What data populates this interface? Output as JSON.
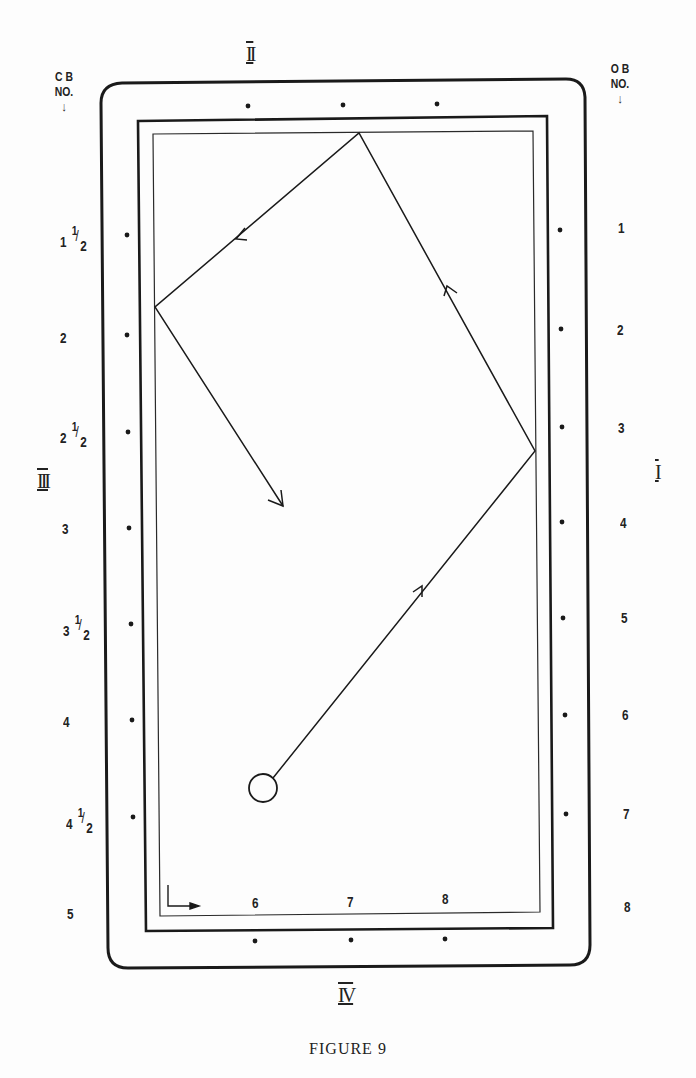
{
  "figure": {
    "caption": "FIGURE 9",
    "headers": {
      "left": {
        "line1": "C B",
        "line2": "NO.",
        "arrow": "↓"
      },
      "right": {
        "line1": "O B",
        "line2": "NO.",
        "arrow": "↓"
      }
    },
    "rail_labels": {
      "top": "II",
      "right": "I",
      "left": "III",
      "bottom": "IV"
    },
    "left_numbers": [
      {
        "whole": "1",
        "fraction": "1/2"
      },
      {
        "whole": "2",
        "fraction": ""
      },
      {
        "whole": "2",
        "fraction": "1/2"
      },
      {
        "whole": "3",
        "fraction": ""
      },
      {
        "whole": "3",
        "fraction": "1/2"
      },
      {
        "whole": "4",
        "fraction": ""
      },
      {
        "whole": "4",
        "fraction": "1/2"
      },
      {
        "whole": "5",
        "fraction": ""
      }
    ],
    "right_numbers": [
      "1",
      "2",
      "3",
      "4",
      "5",
      "6",
      "7",
      "8"
    ],
    "bottom_numbers": [
      "6",
      "7",
      "8"
    ],
    "ball_path": {
      "description": "Cue ball path with direction arrows",
      "points": [
        {
          "name": "ball",
          "x": 263,
          "y": 788
        },
        {
          "name": "rail-I-bounce",
          "x": 535,
          "y": 451
        },
        {
          "name": "rail-II-bounce",
          "x": 359,
          "y": 133
        },
        {
          "name": "rail-III-bounce",
          "x": 155,
          "y": 307
        },
        {
          "name": "end",
          "x": 283,
          "y": 506
        }
      ]
    },
    "colors": {
      "ink": "#1a1a1a",
      "paper": "#fdfdfd"
    }
  }
}
